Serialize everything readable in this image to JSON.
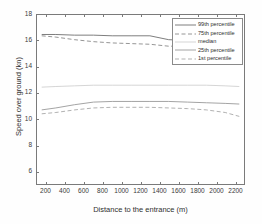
{
  "chart_data": {
    "type": "line",
    "title": "",
    "xlabel": "Distance to the entrance (m)",
    "ylabel": "Speed over ground (kn)",
    "xlim": [
      100,
      2300
    ],
    "ylim": [
      5,
      18
    ],
    "xticks": [
      200,
      400,
      600,
      800,
      1000,
      1200,
      1400,
      1600,
      1800,
      2000,
      2200
    ],
    "yticks": [
      6,
      8,
      10,
      12,
      14,
      16,
      18
    ],
    "grid": false,
    "legend_position": "top-right",
    "x": [
      150,
      300,
      500,
      700,
      900,
      1100,
      1300,
      1500,
      1700,
      1900,
      2100,
      2250
    ],
    "series": [
      {
        "name": "99th percentile",
        "style": "solid",
        "color": "#6f6f6f",
        "values": [
          16.5,
          16.5,
          16.45,
          16.45,
          16.4,
          16.4,
          16.4,
          16.1,
          16.05,
          16.0,
          15.95,
          15.9
        ]
      },
      {
        "name": "75th percentile",
        "style": "dashed",
        "color": "#8a8a8a",
        "values": [
          16.4,
          16.3,
          16.1,
          15.95,
          15.85,
          15.8,
          15.75,
          15.6,
          15.6,
          15.55,
          15.5,
          15.45
        ]
      },
      {
        "name": "median",
        "style": "solid",
        "color": "#d0d0d0",
        "values": [
          12.45,
          12.5,
          12.55,
          12.6,
          12.6,
          12.6,
          12.6,
          12.6,
          12.6,
          12.6,
          12.55,
          12.5
        ]
      },
      {
        "name": "25th percentile",
        "style": "solid",
        "color": "#9a9a9a",
        "values": [
          10.7,
          10.85,
          11.1,
          11.3,
          11.35,
          11.35,
          11.35,
          11.35,
          11.3,
          11.25,
          11.2,
          11.15
        ]
      },
      {
        "name": "1st percentile",
        "style": "dashed",
        "color": "#a8a8a8",
        "values": [
          10.4,
          10.5,
          10.7,
          10.85,
          10.9,
          10.9,
          10.9,
          10.85,
          10.8,
          10.7,
          10.5,
          10.2
        ]
      }
    ]
  },
  "legend": {
    "items": [
      {
        "label": "99th percentile"
      },
      {
        "label": "75th percentile"
      },
      {
        "label": "median"
      },
      {
        "label": "25th percentile"
      },
      {
        "label": "1st percentile"
      }
    ]
  },
  "axes": {
    "x_title": "Distance to the entrance (m)",
    "y_title": "Speed over ground (kn)",
    "x_tick_labels": [
      "200",
      "400",
      "600",
      "800",
      "1000",
      "1200",
      "1400",
      "1600",
      "1800",
      "2000",
      "2200"
    ],
    "y_tick_labels": [
      "6",
      "8",
      "10",
      "12",
      "14",
      "16",
      "18"
    ]
  },
  "colors": {
    "axis": "#7a7a7a",
    "text": "#2e2e2e",
    "background": "#ffffff"
  }
}
